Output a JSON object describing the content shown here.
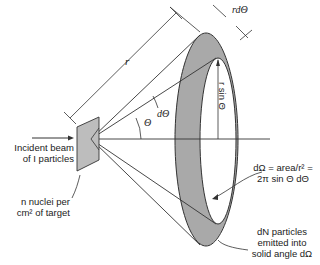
{
  "diagram": {
    "labels": {
      "r": "r",
      "r_dtheta": "rdΘ",
      "d_theta": "dΘ",
      "theta": "Θ",
      "r_sin_theta": "r sin Θ",
      "incident_beam_line1": "Incident beam",
      "incident_beam_line2": "of I particles",
      "target_line1": "n nuclei per",
      "target_line2": "cm² of target",
      "solid_angle_line1": "dΩ = area/r² =",
      "solid_angle_line2": "2π sin Θ dΘ",
      "emitted_line1": "dN particles",
      "emitted_line2": "emitted into",
      "emitted_line3": "solid angle dΩ"
    },
    "colors": {
      "ring_fill": "#a9a9a9",
      "target_fill": "#bdbdbd",
      "line": "#333333"
    }
  }
}
